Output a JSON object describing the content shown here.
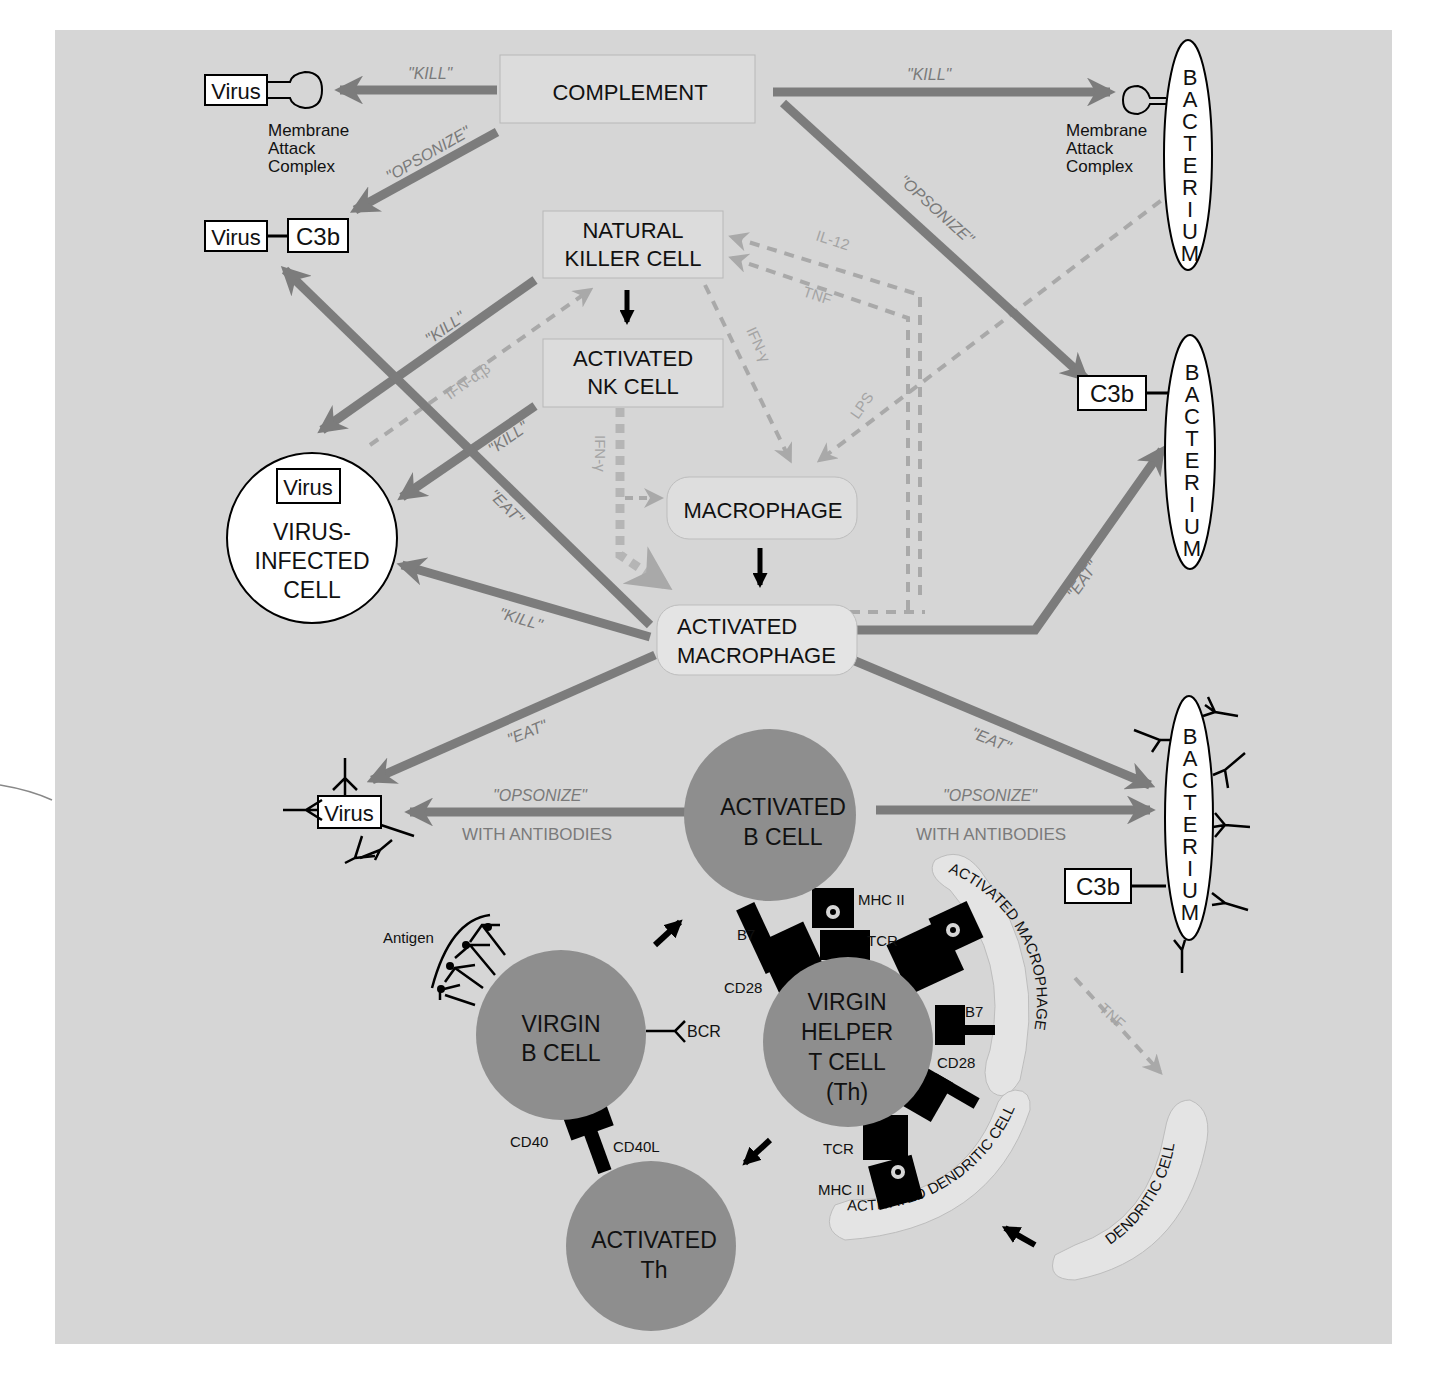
{
  "figure": {
    "panel_background": "#d6d6d6",
    "colors": {
      "action_arrow": "#7c7c7c",
      "cytokine_arrow": "#a9a9a9",
      "cell_fill": "#8e8e8e",
      "box_fill": "#dddddd",
      "receptor": "#000000"
    }
  },
  "nodes": {
    "complement": "COMPLEMENT",
    "nk_cell": [
      "NATURAL",
      "KILLER CELL"
    ],
    "activated_nk": [
      "ACTIVATED",
      "NK CELL"
    ],
    "macrophage": "MACROPHAGE",
    "activated_macrophage": [
      "ACTIVATED",
      "MACROPHAGE"
    ],
    "virus_infected_cell": [
      "VIRUS-",
      "INFECTED",
      "CELL"
    ],
    "activated_b_cell": [
      "ACTIVATED",
      "B CELL"
    ],
    "virgin_b_cell": [
      "VIRGIN",
      "B CELL"
    ],
    "virgin_helper_t": [
      "VIRGIN",
      "HELPER",
      "T CELL",
      "(Th)"
    ],
    "activated_th": [
      "ACTIVATED",
      "Th"
    ],
    "activated_macrophage_arc": "ACTIVATED MACROPHAGE",
    "activated_dendritic_arc": "ACTIVATED DENDRITIC CELL",
    "dendritic_cell": "DENDRITIC CELL"
  },
  "targets": {
    "virus": "Virus",
    "c3b": "C3b",
    "bacterium": [
      "B",
      "A",
      "C",
      "T",
      "E",
      "R",
      "I",
      "U",
      "M"
    ],
    "mac_label": [
      "Membrane",
      "Attack",
      "Complex"
    ]
  },
  "arrow_labels": {
    "kill": "\"KILL\"",
    "opsonize": "\"OPSONIZE\"",
    "eat": "\"EAT\"",
    "with_antibodies": "WITH ANTIBODIES"
  },
  "cytokines": {
    "il12": "IL-12",
    "tnf": "TNF",
    "ifn_gamma": "IFN-γ",
    "ifn_ab": "IFN-α,β",
    "lps": "LPS"
  },
  "receptors": {
    "antigen": "Antigen",
    "bcr": "BCR",
    "b7": "B7",
    "cd28": "CD28",
    "mhc2": "MHC II",
    "tcr": "TCR",
    "cd40": "CD40",
    "cd40l": "CD40L"
  }
}
